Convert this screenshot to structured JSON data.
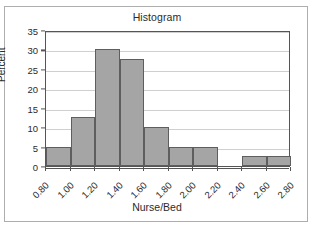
{
  "frame": {
    "border_color": "#aeaeae",
    "background": "#ffffff"
  },
  "chart_data": {
    "type": "bar",
    "title": "Histogram",
    "xlabel": "Nurse/Bed",
    "ylabel": "Percent",
    "ylim": [
      0,
      35
    ],
    "xlim": [
      0.8,
      2.8
    ],
    "grid": true,
    "legend": "none",
    "bar_fill_color": "#a5a5a5",
    "bar_border_color": "#5e5e5e",
    "gridline_color": "#cfcfcf",
    "axis_color": "#555555",
    "y_ticks": [
      0,
      5,
      10,
      15,
      20,
      25,
      30,
      35
    ],
    "y_tick_labels": [
      "0",
      "5",
      "10",
      "15",
      "20",
      "25",
      "30",
      "35"
    ],
    "x_ticks": [
      0.8,
      1.0,
      1.2,
      1.4,
      1.6,
      1.8,
      2.0,
      2.2,
      2.4,
      2.6,
      2.8
    ],
    "x_tick_labels": [
      "0.80",
      "1.00",
      "1.20",
      "1.40",
      "1.60",
      "1.80",
      "2.00",
      "2.20",
      "2.40",
      "2.60",
      "2.80"
    ],
    "bin_width": 0.2,
    "bins": [
      {
        "left": 0.8,
        "right": 1.0,
        "value": 5.0
      },
      {
        "left": 1.0,
        "right": 1.2,
        "value": 12.5
      },
      {
        "left": 1.2,
        "right": 1.4,
        "value": 30.0
      },
      {
        "left": 1.4,
        "right": 1.6,
        "value": 27.5
      },
      {
        "left": 1.6,
        "right": 1.8,
        "value": 10.0
      },
      {
        "left": 1.8,
        "right": 2.0,
        "value": 5.0
      },
      {
        "left": 2.0,
        "right": 2.2,
        "value": 5.0
      },
      {
        "left": 2.2,
        "right": 2.4,
        "value": 0.0
      },
      {
        "left": 2.4,
        "right": 2.6,
        "value": 2.5
      },
      {
        "left": 2.6,
        "right": 2.8,
        "value": 2.5
      }
    ],
    "categories": [
      "0.80-1.00",
      "1.00-1.20",
      "1.20-1.40",
      "1.40-1.60",
      "1.60-1.80",
      "1.80-2.00",
      "2.00-2.20",
      "2.20-2.40",
      "2.40-2.60",
      "2.60-2.80"
    ],
    "values": [
      5.0,
      12.5,
      30.0,
      27.5,
      10.0,
      5.0,
      5.0,
      0.0,
      2.5,
      2.5
    ]
  }
}
